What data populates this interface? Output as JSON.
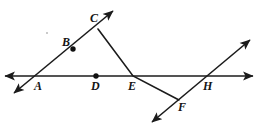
{
  "figure": {
    "kind": "geometry-diagram",
    "width": 261,
    "height": 129,
    "background_color": "#ffffff",
    "stroke_color": "#1b1b1b",
    "label_color": "#141414",
    "dot_color": "#111111",
    "title": "",
    "labels": [
      {
        "id": "A",
        "text": "A",
        "x": 34,
        "y": 80
      },
      {
        "id": "B",
        "text": "B",
        "x": 62,
        "y": 36
      },
      {
        "id": "C",
        "text": "C",
        "x": 90,
        "y": 12
      },
      {
        "id": "D",
        "text": "D",
        "x": 91,
        "y": 80
      },
      {
        "id": "E",
        "text": "E",
        "x": 128,
        "y": 80
      },
      {
        "id": "F",
        "text": "F",
        "x": 178,
        "y": 101
      },
      {
        "id": "H",
        "text": "H",
        "x": 203,
        "y": 80
      }
    ],
    "points": [
      {
        "id": "A",
        "x": 38,
        "y": 76,
        "marked": false
      },
      {
        "id": "B",
        "x": 73,
        "y": 49,
        "marked": true
      },
      {
        "id": "C",
        "x": 98,
        "y": 29,
        "marked": false
      },
      {
        "id": "D",
        "x": 96,
        "y": 76,
        "marked": true
      },
      {
        "id": "E",
        "x": 133,
        "y": 76,
        "marked": false
      },
      {
        "id": "F",
        "x": 176,
        "y": 98,
        "marked": false
      },
      {
        "id": "H",
        "x": 206,
        "y": 76,
        "marked": false
      }
    ],
    "lines": [
      {
        "id": "horizontal-line",
        "name": "line-through-A-D-E-H",
        "x1": 5,
        "y1": 76,
        "x2": 253,
        "y2": 76,
        "arrow_start": true,
        "arrow_end": true
      },
      {
        "id": "diagonal-line-left",
        "name": "line-through-A-B-C",
        "x1": 14,
        "y1": 93,
        "x2": 113,
        "y2": 11,
        "arrow_start": true,
        "arrow_end": true
      },
      {
        "id": "diagonal-line-right",
        "name": "line-through-F-H",
        "x1": 152,
        "y1": 122,
        "x2": 250,
        "y2": 40,
        "arrow_start": true,
        "arrow_end": true
      }
    ],
    "segments": [
      {
        "id": "segment-C-E-F",
        "name": "path-C-to-E-to-F",
        "points": [
          {
            "x": 98,
            "y": 29
          },
          {
            "x": 133,
            "y": 76
          },
          {
            "x": 179,
            "y": 100
          }
        ],
        "arrow_start": false,
        "arrow_end": false
      }
    ],
    "specks": [
      {
        "id": "artifact-speck",
        "x": 47,
        "y": 33,
        "r": 1.0
      }
    ]
  }
}
